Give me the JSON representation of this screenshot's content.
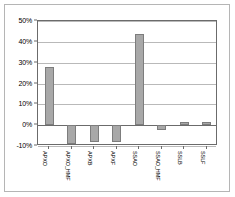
{
  "chart_data": {
    "type": "bar",
    "title": "",
    "xlabel": "",
    "ylabel": "",
    "categories": [
      "APXO",
      "APXO_HMF",
      "APXB",
      "APXF",
      "SSAO",
      "SSAO_HMF",
      "SSLB",
      "SSLF"
    ],
    "values": [
      28,
      -9,
      -8,
      -8,
      44,
      -2.5,
      1.5,
      1.5
    ],
    "ylim": [
      -10,
      50
    ],
    "ytick_values": [
      50,
      40,
      30,
      20,
      10,
      0,
      -10
    ],
    "ytick_labels": [
      "50%",
      "40%",
      "30%",
      "20%",
      "10%",
      "0%",
      "-10%"
    ],
    "grid": true,
    "legend": "none",
    "series_color": "#a8a8a8",
    "series_border_color": "#7d7d7d",
    "axis_color": "#6b6b6b",
    "gridline_color": "#b9b9b9",
    "frame_color": "#b5b5b5",
    "background": "#ffffff"
  }
}
